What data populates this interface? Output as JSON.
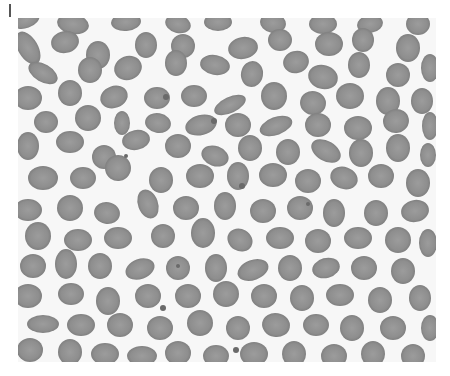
{
  "image": {
    "subject": "peripheral blood smear micrograph",
    "description": "Grayscale light micrograph of densely packed red blood cells (erythrocytes), mostly round to oval with some elongated and crenated (echinocyte) forms, a few small platelets scattered between cells.",
    "colors": {
      "background": "#f7f7f7",
      "cell_fill": "#8e8e8e",
      "cell_rim": "#7a7a7a",
      "cell_center": "#9c9c9c",
      "platelet": "#6a6a6a",
      "marker": "#555555"
    },
    "frame": {
      "x": 18,
      "y": 18,
      "width": 418,
      "height": 344
    },
    "cells": [
      [
        8,
        2,
        14,
        8,
        -20
      ],
      [
        55,
        6,
        16,
        10,
        10
      ],
      [
        108,
        4,
        15,
        9,
        -5
      ],
      [
        160,
        6,
        13,
        9,
        15
      ],
      [
        200,
        4,
        14,
        9,
        0
      ],
      [
        255,
        5,
        13,
        10,
        10
      ],
      [
        305,
        6,
        14,
        10,
        0
      ],
      [
        352,
        6,
        13,
        9,
        -10
      ],
      [
        400,
        6,
        12,
        11,
        0
      ],
      [
        10,
        30,
        10,
        18,
        -30
      ],
      [
        47,
        24,
        14,
        11,
        -10
      ],
      [
        80,
        37,
        12,
        14,
        0
      ],
      [
        128,
        27,
        11,
        13,
        0
      ],
      [
        165,
        28,
        12,
        12,
        0
      ],
      [
        225,
        30,
        15,
        11,
        -10
      ],
      [
        262,
        22,
        12,
        11,
        0
      ],
      [
        311,
        26,
        14,
        12,
        0
      ],
      [
        345,
        22,
        11,
        12,
        0
      ],
      [
        390,
        30,
        12,
        14,
        0
      ],
      [
        25,
        55,
        16,
        9,
        30
      ],
      [
        72,
        52,
        12,
        13,
        0
      ],
      [
        110,
        50,
        14,
        12,
        -20
      ],
      [
        158,
        45,
        11,
        13,
        0
      ],
      [
        197,
        47,
        15,
        10,
        10
      ],
      [
        234,
        56,
        11,
        13,
        10
      ],
      [
        278,
        44,
        13,
        11,
        -15
      ],
      [
        305,
        59,
        15,
        12,
        15
      ],
      [
        341,
        47,
        11,
        13,
        0
      ],
      [
        380,
        57,
        12,
        12,
        0
      ],
      [
        412,
        50,
        9,
        14,
        0
      ],
      [
        10,
        80,
        14,
        12,
        0
      ],
      [
        52,
        75,
        12,
        13,
        0
      ],
      [
        96,
        79,
        14,
        11,
        -20
      ],
      [
        139,
        80,
        13,
        11,
        0
      ],
      [
        176,
        78,
        13,
        11,
        0
      ],
      [
        212,
        87,
        17,
        8,
        -25
      ],
      [
        256,
        78,
        13,
        14,
        0
      ],
      [
        295,
        85,
        13,
        12,
        10
      ],
      [
        332,
        78,
        14,
        13,
        0
      ],
      [
        370,
        83,
        12,
        14,
        0
      ],
      [
        404,
        83,
        11,
        13,
        0
      ],
      [
        28,
        104,
        12,
        11,
        0
      ],
      [
        70,
        100,
        13,
        13,
        0
      ],
      [
        104,
        105,
        8,
        12,
        0
      ],
      [
        140,
        105,
        13,
        10,
        10
      ],
      [
        183,
        107,
        16,
        10,
        -15
      ],
      [
        220,
        107,
        13,
        12,
        0
      ],
      [
        258,
        108,
        17,
        9,
        -20
      ],
      [
        300,
        107,
        13,
        12,
        0
      ],
      [
        340,
        110,
        14,
        12,
        0
      ],
      [
        378,
        103,
        13,
        12,
        -10
      ],
      [
        412,
        108,
        8,
        14,
        0
      ],
      [
        10,
        128,
        11,
        14,
        0
      ],
      [
        52,
        124,
        14,
        11,
        0
      ],
      [
        86,
        139,
        12,
        12,
        0
      ],
      [
        118,
        122,
        14,
        10,
        -10
      ],
      [
        160,
        128,
        13,
        12,
        0
      ],
      [
        197,
        138,
        14,
        10,
        20
      ],
      [
        232,
        130,
        12,
        13,
        0
      ],
      [
        270,
        134,
        12,
        13,
        0
      ],
      [
        308,
        133,
        16,
        10,
        30
      ],
      [
        343,
        135,
        12,
        14,
        0
      ],
      [
        380,
        130,
        12,
        14,
        0
      ],
      [
        410,
        137,
        8,
        12,
        0
      ],
      [
        25,
        160,
        15,
        12,
        0
      ],
      [
        65,
        160,
        13,
        11,
        0
      ],
      [
        100,
        150,
        13,
        13,
        -10
      ],
      [
        143,
        162,
        12,
        13,
        0
      ],
      [
        182,
        158,
        14,
        12,
        0
      ],
      [
        220,
        158,
        11,
        14,
        0
      ],
      [
        255,
        157,
        14,
        12,
        0
      ],
      [
        290,
        163,
        13,
        12,
        0
      ],
      [
        326,
        160,
        14,
        11,
        20
      ],
      [
        363,
        158,
        13,
        12,
        0
      ],
      [
        400,
        165,
        12,
        14,
        0
      ],
      [
        10,
        192,
        14,
        11,
        0
      ],
      [
        52,
        190,
        13,
        13,
        0
      ],
      [
        89,
        195,
        13,
        11,
        10
      ],
      [
        130,
        186,
        10,
        15,
        -20
      ],
      [
        168,
        190,
        13,
        12,
        0
      ],
      [
        207,
        188,
        11,
        14,
        0
      ],
      [
        245,
        193,
        13,
        12,
        0
      ],
      [
        282,
        190,
        13,
        12,
        0
      ],
      [
        316,
        195,
        11,
        14,
        0
      ],
      [
        358,
        195,
        12,
        13,
        0
      ],
      [
        397,
        193,
        14,
        11,
        -10
      ],
      [
        20,
        218,
        13,
        14,
        0
      ],
      [
        60,
        222,
        14,
        11,
        0
      ],
      [
        100,
        220,
        14,
        11,
        0
      ],
      [
        145,
        218,
        12,
        12,
        0
      ],
      [
        185,
        215,
        12,
        15,
        0
      ],
      [
        222,
        222,
        13,
        11,
        30
      ],
      [
        262,
        220,
        14,
        11,
        0
      ],
      [
        300,
        223,
        13,
        12,
        0
      ],
      [
        340,
        220,
        14,
        11,
        0
      ],
      [
        380,
        222,
        13,
        13,
        0
      ],
      [
        410,
        225,
        9,
        14,
        0
      ],
      [
        15,
        248,
        13,
        12,
        0
      ],
      [
        48,
        246,
        11,
        15,
        0
      ],
      [
        82,
        248,
        12,
        13,
        0
      ],
      [
        122,
        251,
        15,
        10,
        -20
      ],
      [
        160,
        250,
        12,
        12,
        0
      ],
      [
        198,
        250,
        11,
        14,
        0
      ],
      [
        235,
        252,
        16,
        10,
        -20
      ],
      [
        272,
        250,
        12,
        13,
        0
      ],
      [
        308,
        250,
        14,
        10,
        -15
      ],
      [
        346,
        250,
        13,
        12,
        0
      ],
      [
        385,
        253,
        12,
        13,
        0
      ],
      [
        10,
        278,
        14,
        12,
        0
      ],
      [
        53,
        276,
        13,
        11,
        0
      ],
      [
        90,
        283,
        12,
        14,
        0
      ],
      [
        130,
        278,
        13,
        12,
        0
      ],
      [
        170,
        278,
        13,
        12,
        0
      ],
      [
        208,
        276,
        13,
        13,
        0
      ],
      [
        246,
        278,
        13,
        12,
        0
      ],
      [
        284,
        280,
        12,
        13,
        0
      ],
      [
        322,
        277,
        14,
        11,
        0
      ],
      [
        362,
        282,
        12,
        13,
        0
      ],
      [
        402,
        280,
        11,
        13,
        0
      ],
      [
        25,
        306,
        16,
        9,
        0
      ],
      [
        63,
        307,
        14,
        11,
        0
      ],
      [
        102,
        307,
        13,
        12,
        0
      ],
      [
        142,
        310,
        13,
        12,
        0
      ],
      [
        182,
        305,
        13,
        13,
        0
      ],
      [
        220,
        310,
        12,
        12,
        0
      ],
      [
        258,
        307,
        14,
        12,
        10
      ],
      [
        298,
        307,
        13,
        11,
        0
      ],
      [
        334,
        310,
        12,
        13,
        0
      ],
      [
        375,
        310,
        13,
        12,
        0
      ],
      [
        412,
        310,
        9,
        13,
        0
      ],
      [
        12,
        332,
        13,
        12,
        0
      ],
      [
        52,
        334,
        12,
        13,
        0
      ],
      [
        87,
        336,
        14,
        11,
        0
      ],
      [
        124,
        338,
        15,
        10,
        0
      ],
      [
        160,
        335,
        13,
        12,
        0
      ],
      [
        198,
        338,
        13,
        11,
        0
      ],
      [
        236,
        336,
        14,
        12,
        0
      ],
      [
        276,
        336,
        12,
        13,
        0
      ],
      [
        316,
        338,
        13,
        12,
        0
      ],
      [
        355,
        336,
        12,
        13,
        0
      ],
      [
        395,
        338,
        12,
        12,
        0
      ]
    ],
    "platelets": [
      [
        148,
        79,
        3
      ],
      [
        196,
        103,
        3
      ],
      [
        108,
        138,
        2
      ],
      [
        224,
        168,
        3
      ],
      [
        160,
        248,
        2
      ],
      [
        290,
        186,
        2
      ],
      [
        145,
        290,
        3
      ],
      [
        218,
        332,
        3
      ]
    ]
  }
}
